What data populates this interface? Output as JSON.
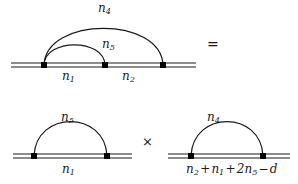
{
  "figure": {
    "colors": {
      "line": "#1a1a1a",
      "background": "#ffffff",
      "vertex": "#000000"
    },
    "operators": {
      "equals": "=",
      "times": "×",
      "plus": "+",
      "minus": "−"
    }
  },
  "top_diagram": {
    "name": "two-loop-diagram",
    "outer_arc_label": "n",
    "outer_arc_sub": "4",
    "inner_arc_label": "n",
    "inner_arc_sub": "5",
    "left_propagator_label": "n",
    "left_propagator_sub": "1",
    "right_propagator_label": "n",
    "right_propagator_sub": "2"
  },
  "bottom_left_diagram": {
    "name": "one-loop-diagram-left",
    "arc_label": "n",
    "arc_sub": "5",
    "line_label": "n",
    "line_sub": "1"
  },
  "bottom_right_diagram": {
    "name": "one-loop-diagram-right",
    "arc_label": "n",
    "arc_sub": "4",
    "line_expression": {
      "terms": [
        {
          "base": "n",
          "sub": "2",
          "op": ""
        },
        {
          "base": "n",
          "sub": "1",
          "op": "+"
        },
        {
          "base": "2n",
          "sub": "5",
          "op": "+"
        },
        {
          "base": "d",
          "sub": "",
          "op": "−"
        }
      ],
      "plain_text": "n2 + n1 + 2n5 − d"
    }
  }
}
